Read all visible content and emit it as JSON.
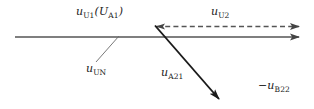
{
  "figure": {
    "kind": "phasor-vector-diagram",
    "width": 314,
    "height": 109,
    "background": "#ffffff",
    "line_color": "#555555",
    "dark_line_color": "#222222",
    "text_color": "#1a1a1a"
  },
  "labels": {
    "u_u1": {
      "base": "u",
      "sub": "U1",
      "open": "(",
      "base2": "U",
      "sub2": "A1",
      "close": ")"
    },
    "u_u2": {
      "base": "u",
      "sub": "U2"
    },
    "u_un": {
      "base": "u",
      "sub": "UN"
    },
    "u_a21": {
      "base": "u",
      "sub": "A21"
    },
    "u_b22": {
      "minus": "−",
      "base": "u",
      "sub": "B22"
    }
  },
  "vectors": [
    {
      "name": "u-u1-main-axis",
      "style": "solid",
      "from": [
        15,
        37
      ],
      "to": [
        300,
        37
      ],
      "arrow": true
    },
    {
      "name": "u-u2-dashed",
      "style": "dashed",
      "from": [
        156,
        26
      ],
      "to": [
        300,
        26
      ],
      "arrow": true
    },
    {
      "name": "u-a21-diagonal",
      "style": "solid",
      "from": [
        155,
        26
      ],
      "to": [
        222,
        103
      ],
      "arrow": true
    },
    {
      "name": "u-un-leader",
      "style": "thin",
      "from": [
        96,
        62
      ],
      "to": [
        118,
        36
      ],
      "arrow": false
    }
  ]
}
